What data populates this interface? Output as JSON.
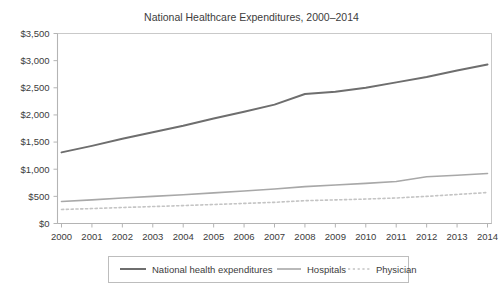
{
  "chart_data": {
    "type": "line",
    "title": "National Healthcare Expenditures, 2000–2014",
    "xlabel": "",
    "ylabel": "",
    "categories": [
      "2000",
      "2001",
      "2002",
      "2003",
      "2004",
      "2005",
      "2006",
      "2007",
      "2008",
      "2009",
      "2010",
      "2011",
      "2012",
      "2013",
      "2014"
    ],
    "x_tick_labels": [
      "2000",
      "2001",
      "2002",
      "2003",
      "2004",
      "2005",
      "2006",
      "2007",
      "2008",
      "2009",
      "2010",
      "2011",
      "2012",
      "2013",
      "2014"
    ],
    "y_tick_labels": [
      "$0",
      "$500",
      "$1,000",
      "$1,500",
      "$2,000",
      "$2,500",
      "$3,000",
      "$3,500"
    ],
    "y_tick_values": [
      0,
      500,
      1000,
      1500,
      2000,
      2500,
      3000,
      3500
    ],
    "ylim": [
      0,
      3500
    ],
    "grid": false,
    "legend_position": "bottom",
    "series": [
      {
        "name": "National health expenditures",
        "style": "solid",
        "color": "#6e6e6e",
        "width": 2.0,
        "values": [
          1310,
          1430,
          1560,
          1680,
          1800,
          1935,
          2060,
          2190,
          2385,
          2425,
          2500,
          2600,
          2700,
          2820,
          2930
        ]
      },
      {
        "name": "Hospitals",
        "style": "solid",
        "color": "#a8a8a8",
        "width": 1.6,
        "values": [
          405,
          435,
          470,
          500,
          530,
          565,
          600,
          635,
          680,
          710,
          740,
          775,
          860,
          890,
          920
        ]
      },
      {
        "name": "Physician",
        "style": "dotted",
        "color": "#c4c4c4",
        "width": 1.6,
        "values": [
          258,
          275,
          295,
          312,
          330,
          350,
          370,
          390,
          420,
          435,
          450,
          470,
          500,
          535,
          570
        ]
      }
    ]
  },
  "legend": {
    "items": [
      {
        "label": "National health expenditures"
      },
      {
        "label": "Hospitals"
      },
      {
        "label": "Physician"
      }
    ]
  }
}
